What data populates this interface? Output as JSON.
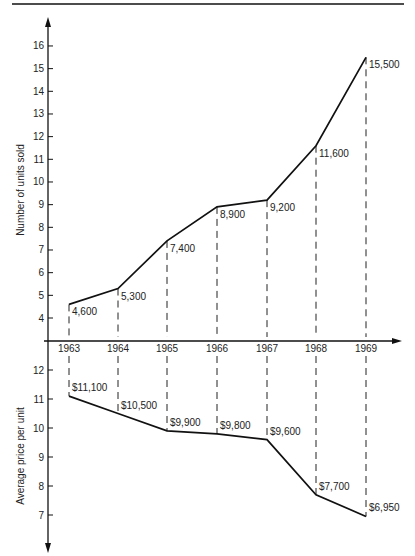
{
  "chart_data": [
    {
      "type": "line",
      "title": "",
      "xlabel": "",
      "ylabel": "Number of units sold",
      "y_unit_note": "thousands",
      "categories": [
        "1963",
        "1964",
        "1965",
        "1966",
        "1967",
        "1968",
        "1969"
      ],
      "values": [
        4.6,
        5.3,
        7.4,
        8.9,
        9.2,
        11.6,
        15.5
      ],
      "data_labels": [
        "4,600",
        "5,300",
        "7,400",
        "8,900",
        "9,200",
        "11,600",
        "15,500"
      ],
      "yticks": [
        4,
        5,
        6,
        7,
        8,
        9,
        10,
        11,
        12,
        13,
        14,
        15,
        16
      ],
      "ylim": [
        3.1,
        16.7
      ],
      "grid": false,
      "drop_lines": "dashed"
    },
    {
      "type": "line",
      "title": "",
      "xlabel": "",
      "ylabel": "Average price per unit",
      "y_unit_note": "thousands of dollars, axis inverted below shared year axis",
      "categories": [
        "1963",
        "1964",
        "1965",
        "1966",
        "1967",
        "1968",
        "1969"
      ],
      "values": [
        11.1,
        10.5,
        9.9,
        9.8,
        9.6,
        7.7,
        6.95
      ],
      "data_labels": [
        "$11,100",
        "$10,500",
        "$9,900",
        "$9,800",
        "$9,600",
        "$7,700",
        "$6,950"
      ],
      "yticks": [
        7,
        8,
        9,
        10,
        11,
        12
      ],
      "ylim": [
        6.0,
        12.8
      ],
      "grid": false,
      "drop_lines": "dashed"
    }
  ],
  "axes": {
    "top_ylabel": "Number of units sold",
    "bottom_ylabel": "Average price per unit",
    "years": [
      "1963",
      "1964",
      "1965",
      "1966",
      "1967",
      "1968",
      "1969"
    ],
    "top_ticks": [
      "16",
      "15",
      "14",
      "13",
      "12",
      "11",
      "10",
      "9",
      "8",
      "7",
      "6",
      "5",
      "4"
    ],
    "bottom_ticks": [
      "12",
      "11",
      "10",
      "9",
      "8",
      "7"
    ]
  },
  "labels": {
    "units": [
      "4,600",
      "5,300",
      "7,400",
      "8,900",
      "9,200",
      "11,600",
      "15,500"
    ],
    "price": [
      "$11,100",
      "$10,500",
      "$9,900",
      "$9,800",
      "$9,600",
      "$7,700",
      "$6,950"
    ]
  }
}
